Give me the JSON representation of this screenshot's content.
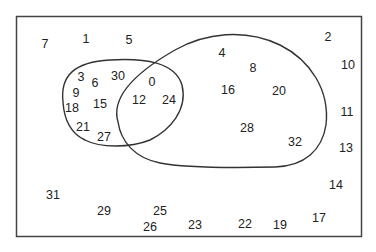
{
  "diagram": {
    "type": "venn",
    "frame_color": "#444444",
    "curve_color": "#333333",
    "sets": [
      {
        "name": "left-set",
        "elements": [
          "3",
          "6",
          "30",
          "9",
          "18",
          "15",
          "21",
          "27",
          "0",
          "12",
          "24"
        ]
      },
      {
        "name": "right-set",
        "elements": [
          "0",
          "12",
          "24",
          "4",
          "8",
          "16",
          "20",
          "28",
          "32"
        ]
      }
    ],
    "numbers": [
      {
        "id": "n7",
        "label": "7",
        "x": 45,
        "y": 45
      },
      {
        "id": "n1",
        "label": "1",
        "x": 86,
        "y": 40
      },
      {
        "id": "n5",
        "label": "5",
        "x": 129,
        "y": 41
      },
      {
        "id": "n2",
        "label": "2",
        "x": 328,
        "y": 38
      },
      {
        "id": "n10",
        "label": "10",
        "x": 348,
        "y": 66
      },
      {
        "id": "n4",
        "label": "4",
        "x": 222,
        "y": 54
      },
      {
        "id": "n8",
        "label": "8",
        "x": 253,
        "y": 69
      },
      {
        "id": "n16",
        "label": "16",
        "x": 228,
        "y": 91
      },
      {
        "id": "n20",
        "label": "20",
        "x": 279,
        "y": 92
      },
      {
        "id": "n11",
        "label": "11",
        "x": 347,
        "y": 113
      },
      {
        "id": "n28",
        "label": "28",
        "x": 247,
        "y": 129
      },
      {
        "id": "n32",
        "label": "32",
        "x": 295,
        "y": 143
      },
      {
        "id": "n13",
        "label": "13",
        "x": 346,
        "y": 149
      },
      {
        "id": "n3",
        "label": "3",
        "x": 81,
        "y": 78
      },
      {
        "id": "n6",
        "label": "6",
        "x": 95,
        "y": 84
      },
      {
        "id": "n30",
        "label": "30",
        "x": 118,
        "y": 77
      },
      {
        "id": "n0",
        "label": "0",
        "x": 152,
        "y": 83
      },
      {
        "id": "n9",
        "label": "9",
        "x": 76,
        "y": 94
      },
      {
        "id": "n18",
        "label": "18",
        "x": 72,
        "y": 109
      },
      {
        "id": "n15",
        "label": "15",
        "x": 100,
        "y": 105
      },
      {
        "id": "n12",
        "label": "12",
        "x": 139,
        "y": 101
      },
      {
        "id": "n24",
        "label": "24",
        "x": 169,
        "y": 101
      },
      {
        "id": "n21",
        "label": "21",
        "x": 83,
        "y": 128
      },
      {
        "id": "n27",
        "label": "27",
        "x": 104,
        "y": 138
      },
      {
        "id": "n31",
        "label": "31",
        "x": 53,
        "y": 196
      },
      {
        "id": "n29",
        "label": "29",
        "x": 104,
        "y": 212
      },
      {
        "id": "n25",
        "label": "25",
        "x": 160,
        "y": 212
      },
      {
        "id": "n26",
        "label": "26",
        "x": 150,
        "y": 228
      },
      {
        "id": "n23",
        "label": "23",
        "x": 195,
        "y": 226
      },
      {
        "id": "n22",
        "label": "22",
        "x": 245,
        "y": 225
      },
      {
        "id": "n19",
        "label": "19",
        "x": 280,
        "y": 226
      },
      {
        "id": "n17",
        "label": "17",
        "x": 319,
        "y": 219
      },
      {
        "id": "n14",
        "label": "14",
        "x": 336,
        "y": 186
      }
    ]
  }
}
